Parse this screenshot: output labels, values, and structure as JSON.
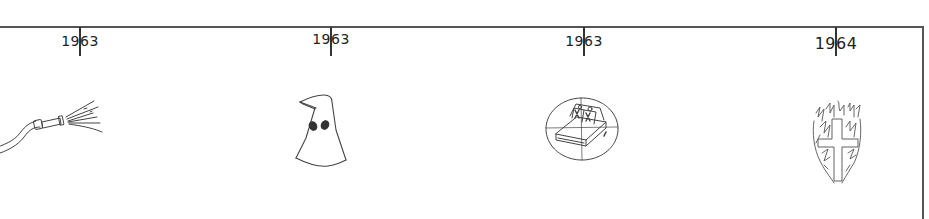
{
  "timeline": {
    "events": [
      {
        "year": "1963",
        "icon": "fire-hose-icon",
        "x": 80,
        "label_top": 33,
        "font_size": 14
      },
      {
        "year": "1963",
        "icon": "hooded-figure-icon",
        "x": 331,
        "label_top": 31,
        "font_size": 14
      },
      {
        "year": "1963",
        "icon": "bombed-church-target-icon",
        "x": 584,
        "label_top": 33,
        "font_size": 14
      },
      {
        "year": "1964",
        "icon": "burning-cross-icon",
        "x": 836,
        "label_top": 35,
        "font_size": 16
      }
    ]
  },
  "colors": {
    "line": "#555555",
    "tick": "#333333",
    "text": "#222222",
    "drawing": "#444444",
    "background": "#ffffff"
  }
}
